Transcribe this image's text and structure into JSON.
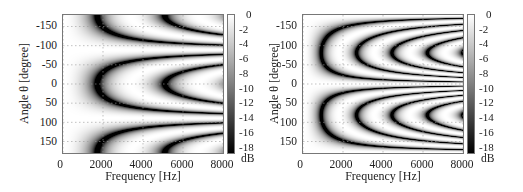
{
  "chart_data": [
    {
      "type": "heatmap",
      "title": "",
      "xlabel": "Frequency [Hz]",
      "ylabel": "Angle θ  [degree]",
      "xlim": [
        0,
        8000
      ],
      "ylim": [
        -180,
        180
      ],
      "x_ticks": [
        "0",
        "2000",
        "4000",
        "6000",
        "8000"
      ],
      "y_ticks": [
        "-150",
        "-100",
        "-50",
        "0",
        "50",
        "100",
        "150"
      ],
      "grid": true,
      "colorbar": {
        "label": "dB",
        "range": [
          -19,
          0
        ],
        "ticks": [
          "0",
          "-2",
          "-4",
          "-6",
          "-8",
          "-10",
          "-12",
          "-14",
          "-16",
          "-18"
        ],
        "colormap": "gray"
      },
      "pattern": {
        "description": "Interference fringes; bright band near ±90° and low frequencies, nested dark arcs centered on 0° and ±180° opening to the right",
        "mode": "broadside",
        "onset_hz": 1700,
        "spacing": 0.27,
        "null_angles_deg": [
          -90,
          90
        ]
      }
    },
    {
      "type": "heatmap",
      "title": "",
      "xlabel": "Frequency [Hz]",
      "ylabel": "Angle θ  [degree]",
      "xlim": [
        0,
        8000
      ],
      "ylim": [
        -180,
        180
      ],
      "x_ticks": [
        "0",
        "2000",
        "4000",
        "6000",
        "8000"
      ],
      "y_ticks": [
        "-150",
        "-100",
        "-50",
        "0",
        "50",
        "100",
        "150"
      ],
      "grid": true,
      "colorbar": {
        "label": "dB",
        "range": [
          -19,
          0
        ],
        "ticks": [
          "0",
          "-2",
          "-4",
          "-6",
          "-8",
          "-10",
          "-12",
          "-14",
          "-16",
          "-18"
        ],
        "colormap": "gray"
      },
      "pattern": {
        "description": "Bright band around 0° across all frequencies; dark curved fringes in upper and lower halves starting near 900 Hz at ±180°",
        "mode": "endfire",
        "onset_hz": 900,
        "spacing": 0.5,
        "null_angles_deg": [
          0
        ]
      }
    }
  ]
}
